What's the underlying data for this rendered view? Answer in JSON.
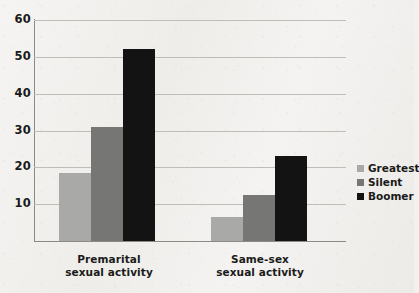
{
  "chart_data": {
    "type": "bar",
    "title": "",
    "subtitle": "",
    "xlabel": "",
    "ylabel": "",
    "categories": [
      "Premarital sexual activity",
      "Same-sex sexual activity"
    ],
    "category_lines": [
      [
        "Premarital",
        "sexual activity"
      ],
      [
        "Same-sex",
        "sexual activity"
      ]
    ],
    "series": [
      {
        "name": "Greatest",
        "color": "#a9a9a7",
        "values": [
          18.5,
          6.5
        ]
      },
      {
        "name": "Silent",
        "color": "#767674",
        "values": [
          31,
          12.5
        ]
      },
      {
        "name": "Boomer",
        "color": "#131313",
        "values": [
          52,
          23
        ]
      }
    ],
    "ylim": [
      0,
      60
    ],
    "yticks": [
      10,
      20,
      30,
      40,
      50,
      60
    ],
    "ytick_labels": [
      "10",
      "20",
      "30",
      "40",
      "50",
      "60"
    ],
    "grid": true,
    "legend_position": "right"
  },
  "legend": {
    "entries": [
      {
        "label": "Greatest",
        "swatch": "legend-swatch-greatest"
      },
      {
        "label": "Silent",
        "swatch": "legend-swatch-silent"
      },
      {
        "label": "Boomer",
        "swatch": "legend-swatch-boomer"
      }
    ]
  },
  "colors": {
    "background": "#f2f1ef",
    "gridline": "#bfbdb8",
    "axis": "#8c8a86",
    "text": "#1a1a1a",
    "greatest": "#a9a9a7",
    "silent": "#767674",
    "boomer": "#131313"
  }
}
